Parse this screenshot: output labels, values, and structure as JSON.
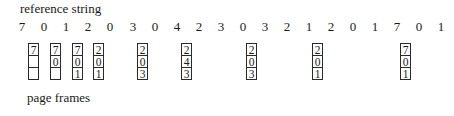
{
  "labels": {
    "reference_string": "reference string",
    "page_frames": "page frames"
  },
  "reference_string": [
    "7",
    "0",
    "1",
    "2",
    "0",
    "3",
    "0",
    "4",
    "2",
    "3",
    "0",
    "3",
    "2",
    "1",
    "2",
    "0",
    "1",
    "7",
    "0",
    "1"
  ],
  "reference_positions_x": [
    22,
    44,
    66,
    88,
    110,
    133,
    155,
    177,
    199,
    221,
    243,
    265,
    287,
    309,
    331,
    353,
    375,
    397,
    419,
    441
  ],
  "frames": [
    {
      "x": 28,
      "cells": [
        "7",
        "",
        ""
      ]
    },
    {
      "x": 50,
      "cells": [
        "7",
        "0",
        ""
      ]
    },
    {
      "x": 72,
      "cells": [
        "7",
        "0",
        "1"
      ]
    },
    {
      "x": 93,
      "cells": [
        "2",
        "0",
        "1"
      ]
    },
    {
      "x": 137,
      "cells": [
        "2",
        "0",
        "3"
      ]
    },
    {
      "x": 181,
      "cells": [
        "2",
        "4",
        "3"
      ]
    },
    {
      "x": 246,
      "cells": [
        "2",
        "0",
        "3"
      ]
    },
    {
      "x": 312,
      "cells": [
        "2",
        "0",
        "1"
      ]
    },
    {
      "x": 400,
      "cells": [
        "7",
        "0",
        "1"
      ]
    }
  ]
}
